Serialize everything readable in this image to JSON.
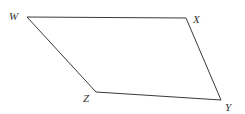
{
  "diagram": {
    "type": "quadrilateral",
    "stroke_color": "#3a3a3a",
    "vertices": [
      {
        "name": "W",
        "x": 27,
        "y": 17,
        "label_x": 9,
        "label_y": 20
      },
      {
        "name": "X",
        "x": 186,
        "y": 18,
        "label_x": 193,
        "label_y": 23
      },
      {
        "name": "Y",
        "x": 221,
        "y": 100,
        "label_x": 225,
        "label_y": 111
      },
      {
        "name": "Z",
        "x": 96,
        "y": 92,
        "label_x": 83,
        "label_y": 102
      }
    ],
    "edges": [
      [
        "W",
        "X"
      ],
      [
        "X",
        "Y"
      ],
      [
        "Y",
        "Z"
      ],
      [
        "Z",
        "W"
      ]
    ]
  }
}
